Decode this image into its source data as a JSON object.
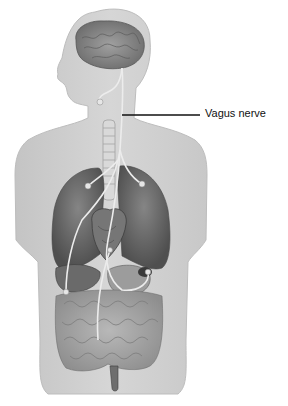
{
  "diagram": {
    "type": "anatomical-illustration",
    "labels": [
      {
        "text": "Vagus nerve",
        "target": "vagus-nerve"
      }
    ],
    "structures": [
      "brain",
      "vagus-nerve",
      "trachea",
      "lungs",
      "heart",
      "stomach",
      "liver",
      "intestines"
    ],
    "colors": {
      "background": "#ffffff",
      "body": "#cfcfcf",
      "body_edge": "#bdbdbd",
      "brain": "#8a8a8a",
      "lung": "#6e6e6e",
      "heart": "#7a7a7a",
      "intestine": "#a8a8a8",
      "nerve": "#ececec",
      "leader_line": "#111111"
    }
  }
}
